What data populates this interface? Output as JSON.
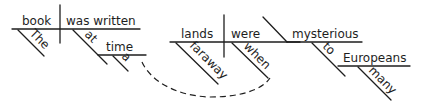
{
  "diagram": {
    "type": "sentence-diagram",
    "sentence": "The book was written at a time when faraway lands were mysterious to many Europeans",
    "words": {
      "subject": "book",
      "verb": "was written",
      "subject_modifier": "The",
      "preposition_1": "at",
      "object_1": "time",
      "object_1_modifier": "a",
      "subject_2": "lands",
      "verb_2": "were",
      "predicate_adjective": "mysterious",
      "subject_2_modifier": "faraway",
      "adverb": "when",
      "preposition_2": "to",
      "object_2": "Europeans",
      "object_2_modifier": "many"
    },
    "colors": {
      "ink": "#1e1e1e",
      "background": "#ffffff"
    }
  }
}
